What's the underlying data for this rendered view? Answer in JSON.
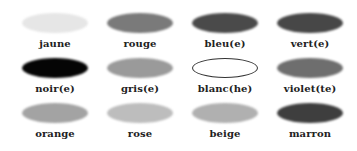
{
  "colors": [
    {
      "label": "jaune",
      "fill": "#e6e6e6",
      "outline": false
    },
    {
      "label": "rouge",
      "fill": "#7a7a7a",
      "outline": false
    },
    {
      "label": "bleu(e)",
      "fill": "#4a4a4a",
      "outline": false
    },
    {
      "label": "vert(e)",
      "fill": "#474747",
      "outline": false
    },
    {
      "label": "noir(e)",
      "fill": "#050505",
      "outline": false
    },
    {
      "label": "gris(e)",
      "fill": "#9a9a9a",
      "outline": false
    },
    {
      "label": "blanc(he)",
      "fill": "#ffffff",
      "outline": true
    },
    {
      "label": "violet(te)",
      "fill": "#6e6e6e",
      "outline": false
    },
    {
      "label": "orange",
      "fill": "#a3a3a3",
      "outline": false
    },
    {
      "label": "rose",
      "fill": "#bdbdbd",
      "outline": false
    },
    {
      "label": "beige",
      "fill": "#b0b0b0",
      "outline": false
    },
    {
      "label": "marron",
      "fill": "#3e3e3e",
      "outline": false
    }
  ]
}
